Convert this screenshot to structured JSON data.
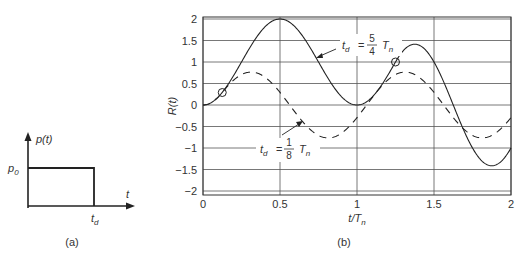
{
  "chart_data": [
    {
      "type": "line",
      "panel": "a",
      "caption": "(a)",
      "title": "Rectangular pulse",
      "ylabel": "p(t)",
      "xlabel": "t",
      "y_level_label": "p0",
      "x_end_label": "td",
      "series": [
        {
          "name": "p(t)",
          "x": [
            "0",
            "0",
            "td",
            "td"
          ],
          "y": [
            "0",
            "p0",
            "p0",
            "0"
          ]
        }
      ]
    },
    {
      "type": "line",
      "panel": "b",
      "caption": "(b)",
      "xlabel": "t/Tn",
      "ylabel": "R(t)",
      "xlim": [
        0,
        2
      ],
      "ylim": [
        -2,
        2
      ],
      "grid": true,
      "xticks": [
        0,
        0.5,
        1,
        1.5,
        2
      ],
      "xtick_labels": [
        "0",
        "0.5",
        "1",
        "1.5",
        "2"
      ],
      "yticks": [
        2,
        1.5,
        1,
        0.5,
        0,
        -0.5,
        -1,
        -1.5,
        -2
      ],
      "ytick_labels": [
        "2",
        "1.5",
        "1",
        "0.5",
        "0",
        "−0.5",
        "−1",
        "−1.5",
        "−2"
      ],
      "series": [
        {
          "name": "td = 5/4 Tn",
          "td_over_Tn": 1.25,
          "style": "solid",
          "label_parts": {
            "var": "t",
            "sub": "d",
            "num": "5",
            "den": "4",
            "unit": "T",
            "unit_sub": "n"
          },
          "x": [
            0,
            0.125,
            0.25,
            0.375,
            0.5,
            0.625,
            0.75,
            0.875,
            1.0,
            1.125,
            1.25,
            1.375,
            1.5,
            1.625,
            1.75,
            1.875,
            2.0
          ],
          "y": [
            0,
            0.29,
            1.0,
            1.71,
            2.0,
            1.71,
            1.0,
            0.29,
            0,
            0.29,
            1.0,
            1.41,
            1.0,
            0,
            -1.0,
            -1.41,
            -1.0
          ],
          "marker_at": {
            "x": 1.25,
            "y": 1.0
          }
        },
        {
          "name": "td = 1/8 Tn",
          "td_over_Tn": 0.125,
          "style": "dashed",
          "label_parts": {
            "var": "t",
            "sub": "d",
            "num": "1",
            "den": "8",
            "unit": "T",
            "unit_sub": "n"
          },
          "x": [
            0,
            0.125,
            0.25,
            0.375,
            0.5,
            0.625,
            0.75,
            0.875,
            1.0,
            1.125,
            1.25,
            1.375,
            1.5,
            1.625,
            1.75,
            1.875,
            2.0
          ],
          "y": [
            0,
            0.29,
            0.71,
            0.71,
            0.29,
            -0.29,
            -0.71,
            -0.71,
            -0.29,
            0.29,
            0.71,
            0.71,
            0.29,
            -0.29,
            -0.71,
            -0.71,
            -0.29
          ],
          "marker_at": {
            "x": 0.125,
            "y": 0.29
          }
        }
      ]
    }
  ]
}
